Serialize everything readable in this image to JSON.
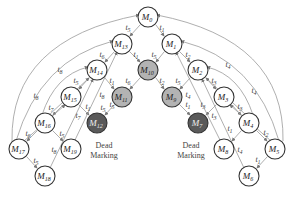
{
  "diagram": {
    "type": "reachability-graph",
    "nodes": [
      {
        "id": "M0",
        "label": "M",
        "sub": "0",
        "x": 148,
        "y": 17,
        "style": "white"
      },
      {
        "id": "M1",
        "label": "M",
        "sub": "1",
        "x": 172,
        "y": 44,
        "style": "white"
      },
      {
        "id": "M2",
        "label": "M",
        "sub": "2",
        "x": 198,
        "y": 70,
        "style": "white"
      },
      {
        "id": "M3",
        "label": "M",
        "sub": "3",
        "x": 224,
        "y": 97,
        "style": "white"
      },
      {
        "id": "M4",
        "label": "M",
        "sub": "4",
        "x": 249,
        "y": 123,
        "style": "white"
      },
      {
        "id": "M5",
        "label": "M",
        "sub": "5",
        "x": 275,
        "y": 149,
        "style": "white"
      },
      {
        "id": "M6",
        "label": "M",
        "sub": "6",
        "x": 249,
        "y": 176,
        "style": "white"
      },
      {
        "id": "M7",
        "label": "M",
        "sub": "7",
        "x": 198,
        "y": 123,
        "style": "dark"
      },
      {
        "id": "M8",
        "label": "M",
        "sub": "8",
        "x": 224,
        "y": 149,
        "style": "white"
      },
      {
        "id": "M9",
        "label": "M",
        "sub": "9",
        "x": 172,
        "y": 97,
        "style": "gray"
      },
      {
        "id": "M10",
        "label": "M",
        "sub": "10",
        "x": 148,
        "y": 70,
        "style": "gray"
      },
      {
        "id": "M11",
        "label": "M",
        "sub": "11",
        "x": 122,
        "y": 97,
        "style": "gray"
      },
      {
        "id": "M12",
        "label": "M",
        "sub": "12",
        "x": 97,
        "y": 123,
        "style": "dark"
      },
      {
        "id": "M13",
        "label": "M",
        "sub": "13",
        "x": 122,
        "y": 44,
        "style": "white"
      },
      {
        "id": "M14",
        "label": "M",
        "sub": "14",
        "x": 97,
        "y": 70,
        "style": "white"
      },
      {
        "id": "M15",
        "label": "M",
        "sub": "15",
        "x": 71,
        "y": 97,
        "style": "white"
      },
      {
        "id": "M16",
        "label": "M",
        "sub": "16",
        "x": 45,
        "y": 123,
        "style": "white"
      },
      {
        "id": "M17",
        "label": "M",
        "sub": "17",
        "x": 19,
        "y": 149,
        "style": "white"
      },
      {
        "id": "M18",
        "label": "M",
        "sub": "18",
        "x": 45,
        "y": 176,
        "style": "white"
      },
      {
        "id": "M19",
        "label": "M",
        "sub": "19",
        "x": 71,
        "y": 149,
        "style": "white"
      }
    ],
    "transition_labels": [
      {
        "t": "t",
        "sub": "5",
        "x": 128,
        "y": 30
      },
      {
        "t": "t",
        "sub": "1",
        "x": 162,
        "y": 30
      },
      {
        "t": "t",
        "sub": "6",
        "x": 102,
        "y": 57
      },
      {
        "t": "t",
        "sub": "1",
        "x": 136,
        "y": 57
      },
      {
        "t": "t",
        "sub": "5",
        "x": 154,
        "y": 57
      },
      {
        "t": "t",
        "sub": "2",
        "x": 188,
        "y": 57
      },
      {
        "t": "t",
        "sub": "4",
        "x": 228,
        "y": 67
      },
      {
        "t": "t",
        "sub": "8",
        "x": 60,
        "y": 72
      },
      {
        "t": "t",
        "sub": "5",
        "x": 76,
        "y": 83
      },
      {
        "t": "t",
        "sub": "1",
        "x": 112,
        "y": 83
      },
      {
        "t": "t",
        "sub": "6",
        "x": 128,
        "y": 83
      },
      {
        "t": "t",
        "sub": "2",
        "x": 162,
        "y": 83
      },
      {
        "t": "t",
        "sub": "5",
        "x": 178,
        "y": 83
      },
      {
        "t": "t",
        "sub": "3",
        "x": 214,
        "y": 83
      },
      {
        "t": "t",
        "sub": "4",
        "x": 254,
        "y": 93
      },
      {
        "t": "t",
        "sub": "8",
        "x": 36,
        "y": 98
      },
      {
        "t": "t",
        "sub": "8",
        "x": 102,
        "y": 97
      },
      {
        "t": "t",
        "sub": "5",
        "x": 112,
        "y": 107
      },
      {
        "t": "t",
        "sub": "4",
        "x": 188,
        "y": 97
      },
      {
        "t": "t",
        "sub": "7",
        "x": 51,
        "y": 110
      },
      {
        "t": "t",
        "sub": "1",
        "x": 88,
        "y": 109
      },
      {
        "t": "t",
        "sub": "5",
        "x": 103,
        "y": 110
      },
      {
        "t": "t",
        "sub": "1",
        "x": 188,
        "y": 107
      },
      {
        "t": "t",
        "sub": "3",
        "x": 203,
        "y": 107
      },
      {
        "t": "t",
        "sub": "3",
        "x": 240,
        "y": 109
      },
      {
        "t": "t",
        "sub": "7",
        "x": 78,
        "y": 118
      },
      {
        "t": "t",
        "sub": "3",
        "x": 214,
        "y": 118
      },
      {
        "t": "t",
        "sub": "6",
        "x": 28,
        "y": 136
      },
      {
        "t": "t",
        "sub": "5",
        "x": 62,
        "y": 136
      },
      {
        "t": "t",
        "sub": "1",
        "x": 230,
        "y": 131
      },
      {
        "t": "t",
        "sub": "2",
        "x": 266,
        "y": 135
      },
      {
        "t": "t",
        "sub": "8",
        "x": 54,
        "y": 152
      },
      {
        "t": "t",
        "sub": "4",
        "x": 240,
        "y": 152
      },
      {
        "t": "t",
        "sub": "5",
        "x": 36,
        "y": 163
      },
      {
        "t": "t",
        "sub": "1",
        "x": 258,
        "y": 162
      }
    ],
    "annotations": [
      {
        "id": "dead-marking-left",
        "line1": "Dead",
        "line2": "Marking",
        "x": 104,
        "y": 148
      },
      {
        "id": "dead-marking-right",
        "line1": "Dead",
        "line2": "Marking",
        "x": 191,
        "y": 148
      }
    ],
    "colors": {
      "white_fill": "#ffffff",
      "gray_fill": "#b3b3b3",
      "dark_fill": "#5a5a5a",
      "stroke": "#333333",
      "edge": "#9a9a9a"
    }
  }
}
